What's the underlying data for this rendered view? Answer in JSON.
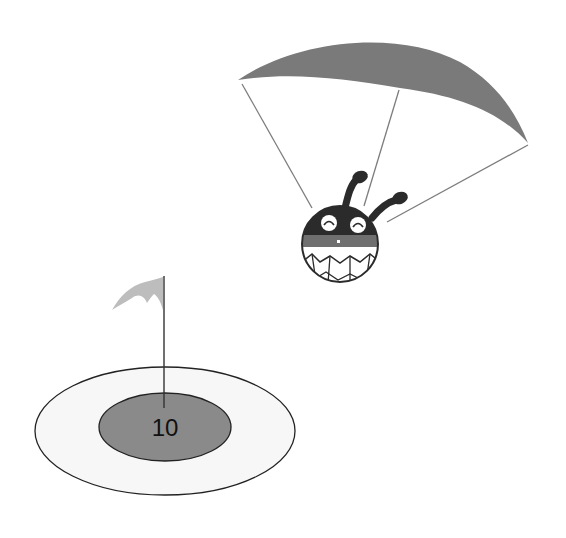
{
  "scene": {
    "description": "Cartoon character parachuting toward a landing target",
    "target": {
      "score_label": "10",
      "outer_ring_color": "#f7f7f7",
      "inner_ring_color": "#8a8a8a",
      "flag_color": "#bdbdbd"
    },
    "parachute": {
      "canopy_color": "#7a7a7a",
      "line_color": "#777777"
    },
    "character": {
      "head_color": "#2b2b2b",
      "band_color": "#6f6f6f",
      "teeth_color": "#ffffff"
    }
  }
}
